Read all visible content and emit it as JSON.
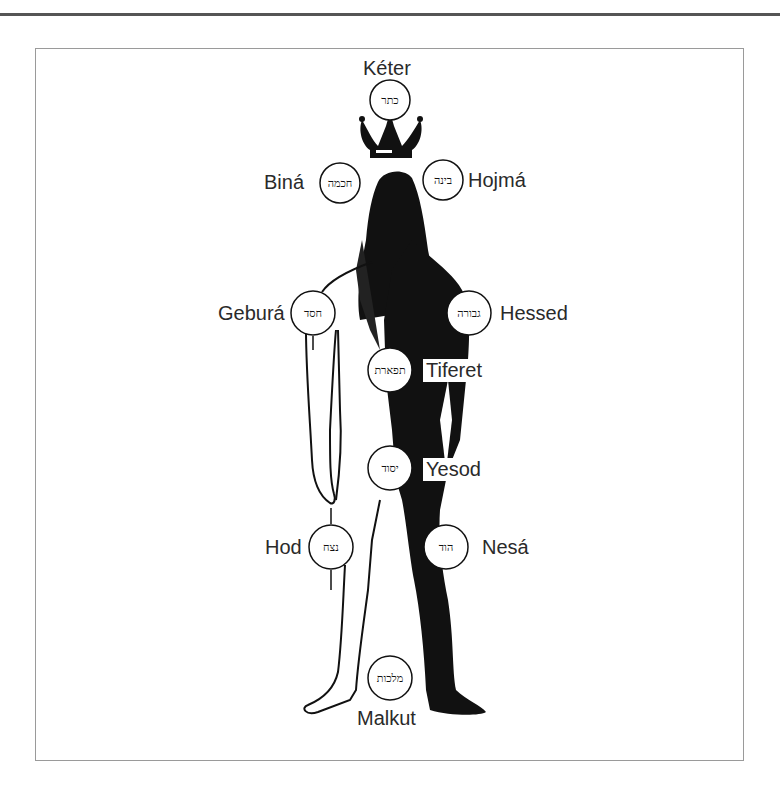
{
  "diagram": {
    "type": "sefirot-body-map",
    "sefirot": [
      {
        "key": "keter",
        "label": "Kéter",
        "hebrew": "כתר"
      },
      {
        "key": "bina",
        "label": "Biná",
        "hebrew": "חכמה"
      },
      {
        "key": "hojma",
        "label": "Hojmá",
        "hebrew": "בינה"
      },
      {
        "key": "gebura",
        "label": "Geburá",
        "hebrew": "חסד"
      },
      {
        "key": "hessed",
        "label": "Hessed",
        "hebrew": "גבורה"
      },
      {
        "key": "tiferet",
        "label": "Tiferet",
        "hebrew": "תפארת"
      },
      {
        "key": "yesod",
        "label": "Yesod",
        "hebrew": "יסוד"
      },
      {
        "key": "hod",
        "label": "Hod",
        "hebrew": "נצח"
      },
      {
        "key": "nesa",
        "label": "Nesá",
        "hebrew": "הוד"
      },
      {
        "key": "malkut",
        "label": "Malkut",
        "hebrew": "מלכות"
      }
    ],
    "colors": {
      "ink": "#111111",
      "label": "#2a2a2a",
      "frame": "#9a9a9a",
      "rule": "#555555"
    }
  }
}
